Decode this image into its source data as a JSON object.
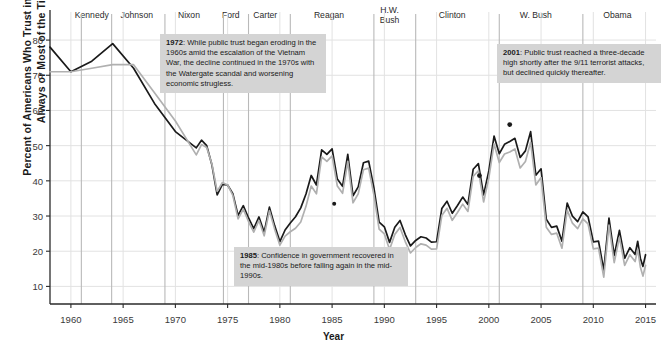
{
  "chart_data": {
    "type": "line",
    "title": "",
    "subtitle": "",
    "xlabel": "Year",
    "ylabel": "Percent of Americans Who Trust in Government\nAlways or Most of the Time",
    "xlim": [
      1958,
      2016
    ],
    "ylim": [
      5,
      84
    ],
    "grid": true,
    "legend_position": "bottom",
    "yticks": [
      10,
      20,
      30,
      40,
      50,
      60,
      70,
      80
    ],
    "xticks": [
      1960,
      1965,
      1970,
      1975,
      1980,
      1985,
      1990,
      1995,
      2000,
      2005,
      2010,
      2015
    ],
    "series": [
      {
        "name": "series-dark",
        "color": "#1a1a1a",
        "points": [
          [
            1958,
            78
          ],
          [
            1960,
            71
          ],
          [
            1962,
            74
          ],
          [
            1964,
            79
          ],
          [
            1966,
            72
          ],
          [
            1968,
            62
          ],
          [
            1970,
            54
          ],
          [
            1972,
            54
          ],
          [
            1974,
            37
          ],
          [
            1976,
            34
          ],
          [
            1978,
            30
          ],
          [
            1980,
            26
          ],
          [
            1982,
            35
          ],
          [
            1984,
            45
          ],
          [
            1986,
            40
          ],
          [
            1988,
            42
          ],
          [
            1990,
            29
          ],
          [
            1992,
            27
          ],
          [
            1994,
            22
          ],
          [
            1996,
            31
          ],
          [
            1998,
            39
          ],
          [
            2000,
            43
          ],
          [
            2002,
            56
          ],
          [
            2004,
            47
          ],
          [
            2006,
            32
          ],
          [
            2008,
            26
          ],
          [
            2010,
            22
          ],
          [
            2012,
            22
          ],
          [
            2014,
            24
          ],
          [
            2015,
            19
          ]
        ]
      },
      {
        "name": "series-light",
        "color": "#b0b0b0",
        "points": [
          [
            1958,
            71
          ],
          [
            1960,
            71
          ],
          [
            1962,
            72
          ],
          [
            1964,
            73
          ],
          [
            1966,
            73
          ],
          [
            1968,
            65
          ],
          [
            1970,
            57
          ],
          [
            1972,
            52
          ],
          [
            1974,
            38
          ],
          [
            1976,
            33
          ],
          [
            1978,
            29
          ],
          [
            1980,
            25
          ],
          [
            1982,
            31
          ],
          [
            1984,
            43
          ],
          [
            1986,
            38
          ],
          [
            1988,
            40
          ],
          [
            1990,
            27
          ],
          [
            1992,
            25
          ],
          [
            1994,
            20
          ],
          [
            1996,
            29
          ],
          [
            1998,
            37
          ],
          [
            2000,
            41
          ],
          [
            2002,
            53
          ],
          [
            2004,
            44
          ],
          [
            2006,
            30
          ],
          [
            2008,
            24
          ],
          [
            2010,
            20
          ],
          [
            2012,
            20
          ],
          [
            2014,
            22
          ],
          [
            2015,
            16
          ]
        ]
      }
    ],
    "annotations": [
      {
        "id": "anno-1972",
        "year_label": "1972",
        "text": "While public trust began eroding in the 1960s amid the escalation of the Vietnam War, the decline continued in the 1970s with the Watergate scandal and worsening economic strugless."
      },
      {
        "id": "anno-1985",
        "year_label": "1985",
        "text": "Confidence in government recovered in the mid-1980s before falling again in the mid-1990s."
      },
      {
        "id": "anno-2001",
        "year_label": "2001",
        "text": "Public trust reached a three-decade high shortly after the 9/11 terrorist attacks, but declined quickly thereafter."
      }
    ]
  },
  "presidents": [
    {
      "name": "Kennedy",
      "x_year": 1962.0
    },
    {
      "name": "Johnson",
      "x_year": 1966.3
    },
    {
      "name": "Nixon",
      "x_year": 1971.3
    },
    {
      "name": "Ford",
      "x_year": 1975.3
    },
    {
      "name": "Carter",
      "x_year": 1978.6
    },
    {
      "name": "Reagan",
      "x_year": 1984.7
    },
    {
      "name": "H.W.\nBush",
      "x_year": 1990.5
    },
    {
      "name": "Clinton",
      "x_year": 1996.5
    },
    {
      "name": "W. Bush",
      "x_year": 2004.5
    },
    {
      "name": "Obama",
      "x_year": 2012.3
    }
  ],
  "president_dividers": [
    1961,
    1963.9,
    1969,
    1974.6,
    1977,
    1981,
    1989,
    1993,
    2001,
    2009
  ],
  "ytick_labels": [
    "80",
    "70",
    "60",
    "50",
    "40",
    "30",
    "20",
    "10"
  ],
  "xtick_labels": [
    "1960",
    "1965",
    "1970",
    "1975",
    "1980",
    "1985",
    "1990",
    "1995",
    "2000",
    "2005",
    "2010",
    "2015"
  ],
  "colors": {
    "series_dark": "#1a1a1a",
    "series_light": "#b0b0b0",
    "grid": "#e2e2e2",
    "divider": "#b9b9b9",
    "axis": "#2a2a2a",
    "annotation_bg": "#d4d4d4",
    "text": "#1a1a1a"
  }
}
